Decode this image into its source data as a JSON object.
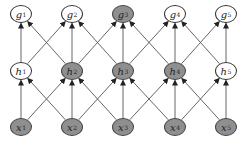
{
  "diagram": {
    "type": "neural-network-graph",
    "colors": {
      "unshaded_fill": "#ffffff",
      "shaded_fill": "#8f8f8f",
      "edge": "#555555",
      "outline": "#333333"
    },
    "columns_x": [
      21,
      72,
      123,
      175,
      226
    ],
    "layers": [
      {
        "name": "output",
        "y": 14,
        "nodes": [
          {
            "var": "g",
            "idx": "1",
            "shaded": false
          },
          {
            "var": "g",
            "idx": "2",
            "shaded": false
          },
          {
            "var": "g",
            "idx": "3",
            "shaded": true
          },
          {
            "var": "g",
            "idx": "4",
            "shaded": false
          },
          {
            "var": "g",
            "idx": "5",
            "shaded": false
          }
        ]
      },
      {
        "name": "hidden",
        "y": 71,
        "nodes": [
          {
            "var": "h",
            "idx": "1",
            "shaded": false
          },
          {
            "var": "h",
            "idx": "2",
            "shaded": true
          },
          {
            "var": "h",
            "idx": "3",
            "shaded": true
          },
          {
            "var": "h",
            "idx": "4",
            "shaded": true
          },
          {
            "var": "h",
            "idx": "5",
            "shaded": false
          }
        ]
      },
      {
        "name": "input",
        "y": 127,
        "nodes": [
          {
            "var": "x",
            "idx": "1",
            "shaded": true
          },
          {
            "var": "x",
            "idx": "2",
            "shaded": true
          },
          {
            "var": "x",
            "idx": "3",
            "shaded": true
          },
          {
            "var": "x",
            "idx": "4",
            "shaded": true
          },
          {
            "var": "x",
            "idx": "5",
            "shaded": true
          }
        ]
      }
    ],
    "connectivity": "each node connects to the node directly above and its left/right neighbors in the next layer (kernel width 3), arrows pointing upward"
  }
}
